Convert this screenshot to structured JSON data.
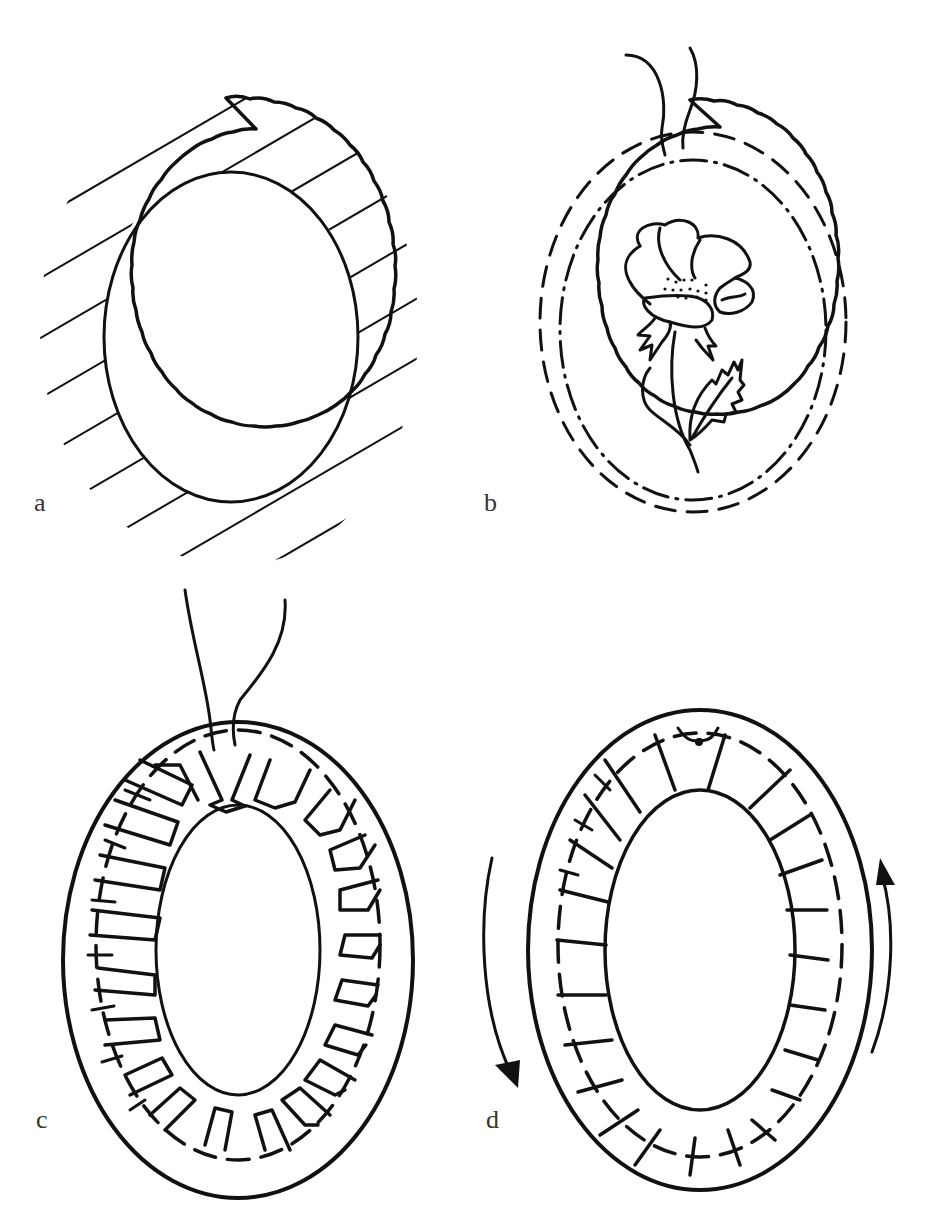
{
  "figure": {
    "type": "diagram",
    "ink_color": "#111111",
    "background": "#ffffff",
    "panels": [
      {
        "id": "a",
        "label": "a",
        "content": "Oval with scalloped outer edge and hatched ring band around a plain oval centre"
      },
      {
        "id": "b",
        "label": "b",
        "content": "Scalloped oval with dashed gathering line, dash-dot inner line, embroidered poppy flower with leaf, two thread ends at top"
      },
      {
        "id": "c",
        "label": "c",
        "content": "Oval with outer solid edge, dashed stitching line and ring of pleated/gathered tabs around inner opening, two thread ends at top"
      },
      {
        "id": "d",
        "label": "d",
        "content": "Oval with pleated tabs flattened around inner opening, dashed stitch line, curved arrows indicating rotation direction"
      }
    ]
  }
}
